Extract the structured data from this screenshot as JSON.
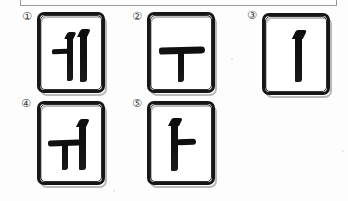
{
  "page": {
    "background_color": "#fdfdfd",
    "ink_color": "#111111",
    "box_border_color": "#9a9a9a",
    "question_box_label": ""
  },
  "options": [
    {
      "marker": "①",
      "jamo": "ㅔ",
      "romanization": "e",
      "card_name": "option-card-1",
      "strokes": "branch-left + two-verticals"
    },
    {
      "marker": "②",
      "jamo": "ㅜ",
      "romanization": "u",
      "card_name": "option-card-2",
      "strokes": "horizontal + descending-vertical"
    },
    {
      "marker": "③",
      "jamo": "ㅣ",
      "romanization": "i",
      "card_name": "option-card-3",
      "strokes": "single-vertical"
    },
    {
      "marker": "④",
      "jamo": "ㅟ",
      "romanization": "wi",
      "card_name": "option-card-4",
      "strokes": "horizontal + vertical + tall-vertical"
    },
    {
      "marker": "⑤",
      "jamo": "ㅏ",
      "romanization": "a",
      "card_name": "option-card-5",
      "strokes": "vertical + right-branch"
    }
  ]
}
